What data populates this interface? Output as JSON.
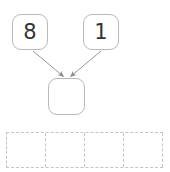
{
  "worksheet": {
    "type": "number-bond",
    "operation": "addition",
    "number_bond": {
      "addend_left": {
        "value": "8",
        "filled": true
      },
      "addend_right": {
        "value": "1",
        "filled": true
      },
      "sum": {
        "value": "",
        "filled": false,
        "placeholder": ""
      },
      "arrow_left": {
        "icon": "arrow-down-right-icon",
        "from": "addend_left",
        "to": "sum"
      },
      "arrow_right": {
        "icon": "arrow-down-left-icon",
        "from": "addend_right",
        "to": "sum"
      }
    },
    "answer_grid": {
      "columns": 4,
      "cells": [
        "",
        "",
        "",
        ""
      ]
    },
    "colors": {
      "box_border": "#b9b9b9",
      "grid_border": "#c4c4c4",
      "arrow": "#8a8a8a",
      "digit": "#333333",
      "background": "#ffffff"
    }
  }
}
